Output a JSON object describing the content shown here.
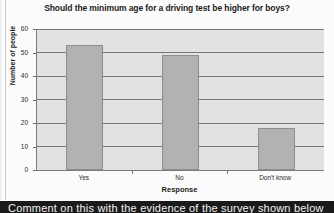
{
  "chart_data": {
    "type": "bar",
    "title": "Should the minimum age for a driving test be higher for boys?",
    "xlabel": "Response",
    "ylabel": "Number of people",
    "categories": [
      "Yes",
      "No",
      "Don't know"
    ],
    "values": [
      53,
      49,
      18
    ],
    "ylim": [
      0,
      60
    ],
    "yticks": [
      0,
      10,
      20,
      30,
      40,
      50,
      60
    ],
    "ytick_labels": [
      "0",
      "10",
      "20",
      "30",
      "40",
      "50",
      "60"
    ],
    "grid": true,
    "legend": false,
    "bar_color": "#b2b2b2",
    "plot_background": "#e2e2e2",
    "axis_color": "#7a7a7a"
  },
  "caption": {
    "text": "Comment on this with the evidence of the survey shown below"
  }
}
